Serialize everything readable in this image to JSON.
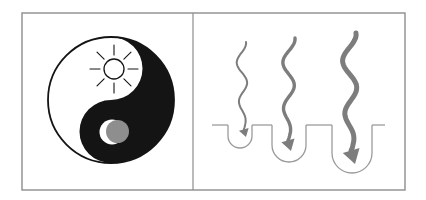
{
  "figure": {
    "title": ""
  },
  "colors": {
    "background": "#ffffff",
    "border": "#8d8d8d",
    "ink": "#141414",
    "arrow_gray": "#7d7d7d",
    "line_gray": "#9b9b9b",
    "moon_gray": "#8e8e8e",
    "white": "#ffffff"
  },
  "diagram": {
    "frame": {
      "x": 22,
      "y": 13,
      "w": 383,
      "h": 177,
      "divider_x": 193
    },
    "yin_yang": {
      "cx": 111,
      "cy": 100,
      "r": 63,
      "lobe_r": 31.5,
      "sun": {
        "cx": 114,
        "cy": 69,
        "r": 10,
        "ray_inner": 14,
        "ray_outer": 24,
        "ray_count": 8
      },
      "moon": {
        "cx": 112,
        "cy": 132,
        "r": 12.5,
        "disc_cx": 117.5,
        "disc_cy": 131.5,
        "disc_r": 11.5
      }
    },
    "ground": {
      "y": 125,
      "x_start": 212,
      "x_end": 385
    },
    "wells": [
      {
        "cx": 240,
        "half_width": 12,
        "depth": 23
      },
      {
        "cx": 289,
        "half_width": 17,
        "depth": 37
      },
      {
        "cx": 352,
        "half_width": 20,
        "depth": 48
      }
    ],
    "arrows": [
      {
        "top_x": 246,
        "top_y": 42,
        "tip_x": 246,
        "tip_y": 137,
        "stroke_width": 2,
        "head": 8,
        "amplitude": 5
      },
      {
        "top_x": 295,
        "top_y": 38,
        "tip_x": 291,
        "tip_y": 151,
        "stroke_width": 3.4,
        "head": 11,
        "amplitude": 6
      },
      {
        "top_x": 356,
        "top_y": 33,
        "tip_x": 355,
        "tip_y": 164,
        "stroke_width": 5,
        "head": 14,
        "amplitude": 7
      }
    ],
    "waves": 2.2,
    "head_angle_deg": 16
  }
}
